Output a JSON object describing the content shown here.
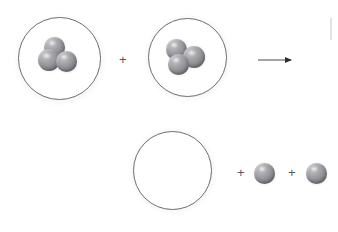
{
  "diagram": {
    "background_color": "#ffffff",
    "atom_color": "#8e8e93",
    "outline_color": "#6e6e72",
    "operator_color": "#58585c",
    "arrow_color": "#4a4a4e"
  },
  "reactants": {
    "vessels": [
      {
        "name": "reactant-vessel-1",
        "atom_count": 3,
        "atoms": [
          {
            "label": "atom",
            "position": "top-center"
          },
          {
            "label": "atom",
            "position": "lower-left"
          },
          {
            "label": "atom",
            "position": "lower-right"
          }
        ]
      },
      {
        "name": "reactant-vessel-2",
        "atom_count": 3,
        "atoms": [
          {
            "label": "atom",
            "position": "upper-left"
          },
          {
            "label": "atom",
            "position": "right"
          },
          {
            "label": "atom",
            "position": "bottom-center"
          }
        ]
      }
    ],
    "operator": "+"
  },
  "arrow": {
    "name": "reaction-arrow",
    "direction": "right",
    "label": ""
  },
  "products": {
    "vessel": {
      "name": "product-vessel-empty",
      "atom_count": 0,
      "contents_label": ""
    },
    "operators": [
      "+",
      "+"
    ],
    "free_atoms": [
      {
        "label": "atom",
        "name": "free-atom-1"
      },
      {
        "label": "atom",
        "name": "free-atom-2"
      }
    ]
  },
  "artifacts": {
    "top_cropped_text": "",
    "right_edge_fragment": ""
  }
}
